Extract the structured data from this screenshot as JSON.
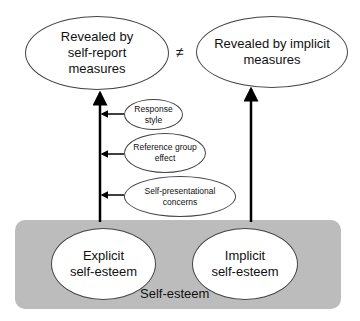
{
  "top": {
    "left_ellipse": [
      "Revealed by",
      "self-report",
      "measures"
    ],
    "right_ellipse": [
      "Revealed by implicit",
      "measures"
    ],
    "not_equal_symbol": "≠"
  },
  "influences": [
    {
      "lines": [
        "Response",
        "style"
      ]
    },
    {
      "lines": [
        "Reference group",
        "effect"
      ]
    },
    {
      "lines": [
        "Self-presentational",
        "concerns"
      ]
    }
  ],
  "bottom": {
    "container_label": "Self-esteem",
    "explicit": [
      "Explicit",
      "self-esteem"
    ],
    "implicit": [
      "Implicit",
      "self-esteem"
    ]
  },
  "colors": {
    "container_fill": "#bcbcbc",
    "ellipse_fill": "#ffffff",
    "line": "#000000"
  }
}
